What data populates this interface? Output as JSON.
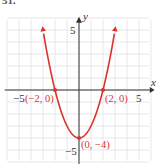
{
  "figure_label": "51.",
  "chart_data": {
    "type": "line",
    "title": "",
    "function": "y = x^2 - 4",
    "xlabel": "x",
    "ylabel": "y",
    "xlim": [
      -6,
      6
    ],
    "ylim": [
      -6,
      6
    ],
    "grid": true,
    "x_ticks_labeled": [
      -5,
      5
    ],
    "y_ticks_labeled": [
      5,
      -5
    ],
    "tick_labels": {
      "x_neg": "−5",
      "x_pos": "5",
      "y_pos": "5",
      "y_neg": "−5"
    },
    "series": [
      {
        "name": "parabola",
        "color": "#d9342b",
        "x": [
          -3,
          -2.5,
          -2,
          -1.5,
          -1,
          -0.5,
          0,
          0.5,
          1,
          1.5,
          2,
          2.5,
          3
        ],
        "y": [
          5,
          2.25,
          0,
          -1.75,
          -3,
          -3.75,
          -4,
          -3.75,
          -3,
          -1.75,
          0,
          2.25,
          5
        ]
      }
    ],
    "annotations": [
      {
        "point": [
          -2,
          0
        ],
        "label": "(−2, 0)"
      },
      {
        "point": [
          2,
          0
        ],
        "label": "(2, 0)"
      },
      {
        "point": [
          0,
          -4
        ],
        "label": "(0, −4)"
      }
    ]
  }
}
